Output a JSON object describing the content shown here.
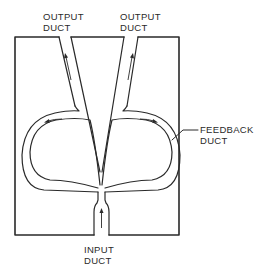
{
  "diagram": {
    "type": "fluidic-amplifier-schematic",
    "labels": {
      "output_left": {
        "line1": "OUTPUT",
        "line2": "DUCT"
      },
      "output_right": {
        "line1": "OUTPUT",
        "line2": "DUCT"
      },
      "feedback": {
        "line1": "FEEDBACK",
        "line2": "DUCT"
      },
      "input": {
        "line1": "INPUT",
        "line2": "DUCT"
      }
    },
    "flow_arrows": [
      "input-duct-up",
      "left-output-up",
      "right-output-up",
      "left-loop-leftward",
      "right-loop-rightward"
    ],
    "colors": {
      "line": "#2a2a2a",
      "background": "#ffffff"
    }
  }
}
